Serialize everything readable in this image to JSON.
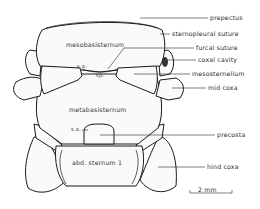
{
  "figure": {
    "type": "anatomical line drawing"
  },
  "internal_labels": {
    "mesobasisternum": "mesobasisternum",
    "sa_upper": "s.a.",
    "sp": "sp.",
    "metabasisternum": "metabasisternum",
    "sa_lower": "s.a.",
    "abd_sternum": "abd. sternum 1"
  },
  "callouts": [
    {
      "id": "prepectus",
      "label": "prepectus"
    },
    {
      "id": "sternopleural-suture",
      "label": "sternopleural  suture"
    },
    {
      "id": "furcal-suture",
      "label": "furcal  suture"
    },
    {
      "id": "coxal-cavity",
      "label": "coxal  cavity"
    },
    {
      "id": "mesosternellum",
      "label": "mesosternellum"
    },
    {
      "id": "mid-coxa",
      "label": "mid  coxa"
    },
    {
      "id": "precosta",
      "label": "precosta"
    },
    {
      "id": "hind-coxa",
      "label": "hind  coxa"
    }
  ],
  "scale_bar": {
    "label": "2  mm",
    "value": 2,
    "unit": "mm"
  }
}
